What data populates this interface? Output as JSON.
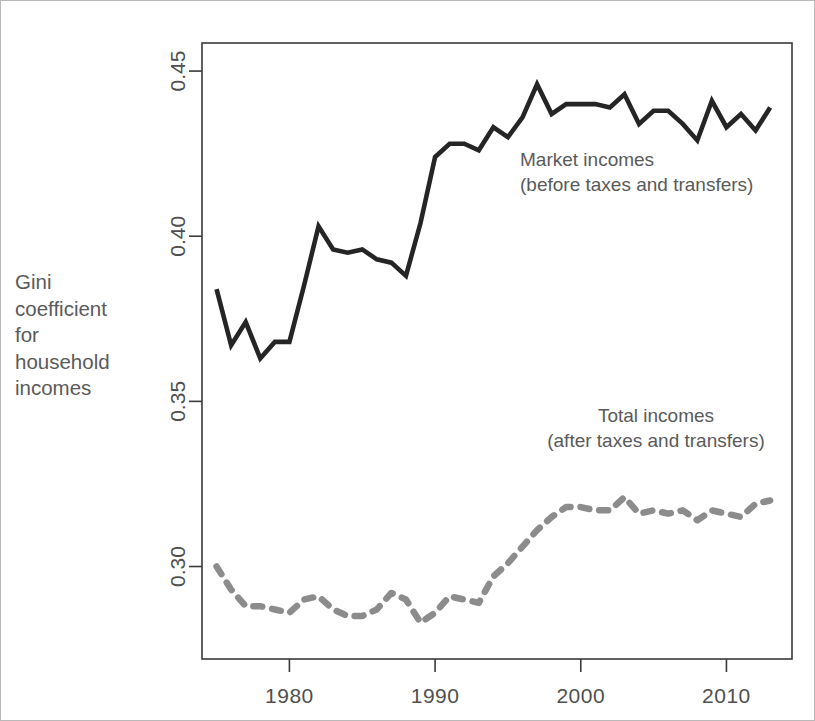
{
  "axis_title": {
    "lines": [
      "Gini",
      "coefficient",
      "for",
      "household",
      "incomes"
    ],
    "full": "Gini coefficient for household incomes"
  },
  "annotations": {
    "market": {
      "line1": "Market incomes",
      "line2": "(before taxes and transfers)"
    },
    "total": {
      "line1": "Total incomes",
      "line2": "(after taxes and transfers)"
    }
  },
  "colors": {
    "market_line": "#252525",
    "total_line": "#8c8c8c",
    "axis": "#3a3a3a",
    "text": "#5a5a5a",
    "frame": "#b9b9b9",
    "background": "#ffffff"
  },
  "chart_data": {
    "type": "line",
    "title": "",
    "subtitle": "",
    "xlabel": "",
    "ylabel": "Gini coefficient for household incomes",
    "xlim": [
      1974,
      2014.5
    ],
    "ylim": [
      0.272,
      0.4585
    ],
    "grid": false,
    "legend_position": "inline-annotation",
    "xticks": [
      1980,
      1990,
      2000,
      2010
    ],
    "xtick_labels": [
      "1980",
      "1990",
      "2000",
      "2010"
    ],
    "yticks": [
      0.3,
      0.35,
      0.4,
      0.45
    ],
    "ytick_labels": [
      "0.30",
      "0.35",
      "0.40",
      "0.45"
    ],
    "x": [
      1975,
      1976,
      1977,
      1978,
      1979,
      1980,
      1981,
      1982,
      1983,
      1984,
      1985,
      1986,
      1987,
      1988,
      1989,
      1990,
      1991,
      1992,
      1993,
      1994,
      1995,
      1996,
      1997,
      1998,
      1999,
      2000,
      2001,
      2002,
      2003,
      2004,
      2005,
      2006,
      2007,
      2008,
      2009,
      2010,
      2011,
      2012,
      2013
    ],
    "series": [
      {
        "name": "Market incomes (before taxes and transfers)",
        "style": "solid",
        "color": "#252525",
        "values": [
          0.384,
          0.367,
          0.374,
          0.363,
          0.368,
          0.368,
          0.385,
          0.403,
          0.396,
          0.395,
          0.396,
          0.393,
          0.392,
          0.388,
          0.404,
          0.424,
          0.428,
          0.428,
          0.426,
          0.433,
          0.43,
          0.436,
          0.446,
          0.437,
          0.44,
          0.44,
          0.44,
          0.439,
          0.443,
          0.434,
          0.438,
          0.438,
          0.434,
          0.429,
          0.441,
          0.433,
          0.437,
          0.432,
          0.439
        ]
      },
      {
        "name": "Total incomes (after taxes and transfers)",
        "style": "dashed",
        "color": "#8c8c8c",
        "values": [
          0.3,
          0.293,
          0.288,
          0.288,
          0.287,
          0.286,
          0.29,
          0.291,
          0.287,
          0.285,
          0.285,
          0.287,
          0.292,
          0.29,
          0.283,
          0.286,
          0.291,
          0.29,
          0.289,
          0.297,
          0.301,
          0.306,
          0.311,
          0.315,
          0.318,
          0.318,
          0.317,
          0.317,
          0.321,
          0.316,
          0.317,
          0.316,
          0.317,
          0.314,
          0.317,
          0.316,
          0.315,
          0.319,
          0.32
        ]
      }
    ]
  }
}
